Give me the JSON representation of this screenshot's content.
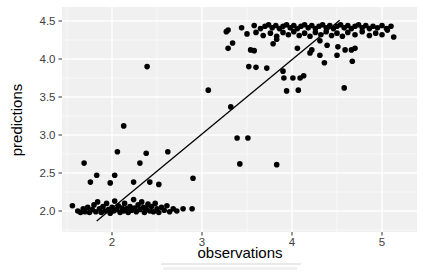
{
  "figure": {
    "width": 423,
    "height": 274,
    "background": "#ffffff",
    "panel_background": "#f0f0f0",
    "grid_color": "#ffffff",
    "point_color": "#000000",
    "line_color": "#000000",
    "tick_color": "#333333",
    "tick_label_color": "#404040",
    "axis_title_color": "#000000"
  },
  "chart_data": {
    "type": "scatter",
    "title": "",
    "xlabel": "observations",
    "ylabel": "predictions",
    "xlim": [
      1.44,
      5.39
    ],
    "ylim": [
      1.72,
      4.68
    ],
    "grid": true,
    "legend": "none",
    "x_ticks": [
      2,
      3,
      4,
      5
    ],
    "x_tick_labels": [
      "2",
      "3",
      "4",
      "5"
    ],
    "x_minor": [
      1.5,
      2.5,
      3.5,
      4.5
    ],
    "y_ticks": [
      2.0,
      2.5,
      3.0,
      3.5,
      4.0,
      4.5
    ],
    "y_tick_labels": [
      "2.0",
      "2.5",
      "3.0",
      "3.5",
      "4.0",
      "4.5"
    ],
    "y_minor": [
      1.75,
      2.25,
      2.75,
      3.25,
      3.75,
      4.25
    ],
    "line": {
      "type": "segment",
      "x1": 1.83,
      "y1": 1.87,
      "x2": 4.53,
      "y2": 4.51
    },
    "points": [
      [
        1.56,
        2.07
      ],
      [
        1.62,
        2.0
      ],
      [
        1.65,
        1.98
      ],
      [
        1.68,
        2.03
      ],
      [
        1.7,
        1.99
      ],
      [
        1.73,
        2.05
      ],
      [
        1.75,
        1.98
      ],
      [
        1.78,
        2.02
      ],
      [
        1.8,
        2.08
      ],
      [
        1.82,
        1.99
      ],
      [
        1.84,
        2.12
      ],
      [
        1.86,
        2.03
      ],
      [
        1.88,
        1.98
      ],
      [
        1.9,
        2.06
      ],
      [
        1.92,
        2.0
      ],
      [
        1.94,
        2.1
      ],
      [
        1.96,
        2.02
      ],
      [
        1.98,
        1.97
      ],
      [
        2.0,
        2.05
      ],
      [
        2.02,
        2.0
      ],
      [
        2.03,
        2.13
      ],
      [
        2.05,
        2.02
      ],
      [
        2.07,
        2.07
      ],
      [
        2.09,
        1.98
      ],
      [
        2.11,
        2.04
      ],
      [
        2.13,
        2.0
      ],
      [
        2.14,
        2.1
      ],
      [
        2.16,
        2.03
      ],
      [
        2.18,
        1.98
      ],
      [
        2.2,
        2.06
      ],
      [
        2.22,
        2.01
      ],
      [
        2.24,
        2.15
      ],
      [
        2.25,
        2.04
      ],
      [
        2.27,
        1.99
      ],
      [
        2.29,
        2.08
      ],
      [
        2.31,
        2.02
      ],
      [
        2.33,
        2.12
      ],
      [
        2.35,
        2.05
      ],
      [
        2.36,
        1.98
      ],
      [
        2.38,
        2.03
      ],
      [
        2.4,
        2.09
      ],
      [
        2.42,
        2.0
      ],
      [
        2.44,
        2.06
      ],
      [
        2.46,
        1.99
      ],
      [
        2.48,
        2.1
      ],
      [
        2.5,
        2.03
      ],
      [
        2.52,
        1.98
      ],
      [
        2.55,
        2.05
      ],
      [
        2.58,
        2.01
      ],
      [
        2.61,
        2.07
      ],
      [
        2.64,
        1.99
      ],
      [
        2.68,
        2.03
      ],
      [
        2.72,
        2.0
      ],
      [
        2.79,
        2.03
      ],
      [
        2.89,
        2.03
      ],
      [
        1.69,
        2.63
      ],
      [
        2.31,
        2.63
      ],
      [
        1.83,
        2.47
      ],
      [
        2.03,
        2.47
      ],
      [
        1.76,
        2.38
      ],
      [
        1.98,
        2.37
      ],
      [
        2.24,
        2.38
      ],
      [
        2.42,
        2.38
      ],
      [
        2.52,
        2.35
      ],
      [
        2.06,
        2.78
      ],
      [
        2.38,
        2.76
      ],
      [
        2.62,
        2.78
      ],
      [
        2.13,
        3.12
      ],
      [
        2.39,
        3.9
      ],
      [
        2.9,
        2.43
      ],
      [
        3.07,
        3.59
      ],
      [
        3.32,
        3.37
      ],
      [
        3.39,
        2.96
      ],
      [
        3.51,
        2.96
      ],
      [
        3.42,
        2.62
      ],
      [
        3.83,
        2.61
      ],
      [
        3.34,
        4.21
      ],
      [
        3.54,
        4.12
      ],
      [
        3.58,
        4.11
      ],
      [
        3.79,
        4.2
      ],
      [
        3.83,
        4.26
      ],
      [
        4.06,
        4.14
      ],
      [
        4.2,
        4.08
      ],
      [
        4.31,
        4.05
      ],
      [
        4.22,
        4.12
      ],
      [
        4.31,
        4.24
      ],
      [
        4.39,
        4.18
      ],
      [
        4.51,
        4.16
      ],
      [
        4.59,
        4.12
      ],
      [
        4.66,
        4.12
      ],
      [
        4.7,
        4.14
      ],
      [
        4.36,
        3.95
      ],
      [
        4.5,
        4.05
      ],
      [
        4.67,
        3.97
      ],
      [
        4.13,
        3.78
      ],
      [
        3.91,
        3.75
      ],
      [
        4.01,
        3.75
      ],
      [
        4.09,
        3.75
      ],
      [
        3.94,
        3.58
      ],
      [
        4.07,
        3.59
      ],
      [
        4.58,
        3.62
      ],
      [
        3.52,
        3.9
      ],
      [
        3.6,
        3.89
      ],
      [
        3.72,
        3.88
      ],
      [
        3.9,
        3.84
      ],
      [
        3.29,
        4.14
      ],
      [
        3.27,
        4.36
      ],
      [
        3.29,
        4.38
      ],
      [
        3.5,
        4.33
      ],
      [
        3.6,
        4.35
      ],
      [
        3.68,
        4.31
      ],
      [
        3.76,
        4.34
      ],
      [
        3.83,
        4.3
      ],
      [
        3.9,
        4.35
      ],
      [
        3.96,
        4.32
      ],
      [
        4.02,
        4.36
      ],
      [
        4.08,
        4.31
      ],
      [
        4.14,
        4.34
      ],
      [
        4.2,
        4.3
      ],
      [
        4.26,
        4.35
      ],
      [
        4.32,
        4.32
      ],
      [
        4.38,
        4.36
      ],
      [
        4.44,
        4.31
      ],
      [
        4.5,
        4.34
      ],
      [
        4.56,
        4.3
      ],
      [
        4.62,
        4.35
      ],
      [
        4.7,
        4.32
      ],
      [
        4.78,
        4.36
      ],
      [
        4.86,
        4.31
      ],
      [
        4.93,
        4.34
      ],
      [
        5.0,
        4.32
      ],
      [
        5.06,
        4.38
      ],
      [
        5.13,
        4.29
      ],
      [
        3.44,
        4.41
      ],
      [
        3.58,
        4.44
      ],
      [
        3.65,
        4.4
      ],
      [
        3.7,
        4.43
      ],
      [
        3.74,
        4.45
      ],
      [
        3.78,
        4.41
      ],
      [
        3.82,
        4.44
      ],
      [
        3.86,
        4.4
      ],
      [
        3.9,
        4.43
      ],
      [
        3.94,
        4.45
      ],
      [
        3.98,
        4.41
      ],
      [
        4.02,
        4.44
      ],
      [
        4.06,
        4.4
      ],
      [
        4.1,
        4.43
      ],
      [
        4.14,
        4.45
      ],
      [
        4.18,
        4.41
      ],
      [
        4.22,
        4.44
      ],
      [
        4.26,
        4.4
      ],
      [
        4.3,
        4.43
      ],
      [
        4.34,
        4.45
      ],
      [
        4.38,
        4.41
      ],
      [
        4.42,
        4.44
      ],
      [
        4.46,
        4.4
      ],
      [
        4.5,
        4.43
      ],
      [
        4.54,
        4.45
      ],
      [
        4.58,
        4.41
      ],
      [
        4.62,
        4.44
      ],
      [
        4.66,
        4.4
      ],
      [
        4.7,
        4.43
      ],
      [
        4.74,
        4.45
      ],
      [
        4.78,
        4.41
      ],
      [
        4.82,
        4.44
      ],
      [
        4.86,
        4.4
      ],
      [
        4.9,
        4.43
      ],
      [
        4.95,
        4.41
      ],
      [
        5.0,
        4.44
      ],
      [
        5.05,
        4.4
      ],
      [
        5.1,
        4.43
      ]
    ]
  },
  "layout_px": {
    "panel": {
      "left": 62,
      "top": 7,
      "right": 417,
      "bottom": 232
    },
    "x_origin": 112,
    "x_scale": 90,
    "y_origin": 211,
    "y_scale": 76,
    "point_radius": 2.8
  }
}
